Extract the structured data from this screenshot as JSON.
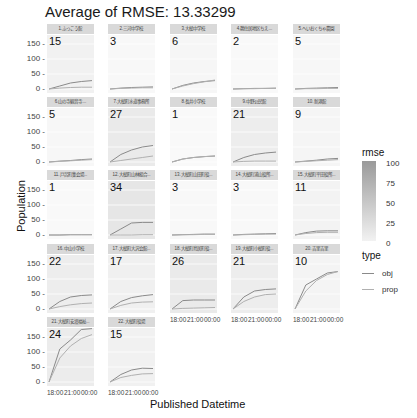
{
  "title": "Average of RMSE: 13.33299",
  "axes": {
    "ylabel": "Population",
    "xlabel": "Published Datetime",
    "yticks": [
      "150 -",
      "100 -",
      "50 -",
      "0 -"
    ],
    "xticks": [
      "18:00",
      "21:00",
      "00:00"
    ]
  },
  "legend": {
    "rmse_title": "rmse",
    "rmse_ticks": [
      "100",
      "75",
      "50",
      "25",
      "0"
    ],
    "type_title": "type",
    "type_items": [
      {
        "label": "obj",
        "color": "#8a8a8a"
      },
      {
        "label": "prop",
        "color": "#b0b0b0"
      }
    ]
  },
  "chart_data": {
    "type": "line",
    "title": "Average of RMSE: 13.33299",
    "xlabel": "Published Datetime",
    "ylabel": "Population",
    "ylim": [
      0,
      160
    ],
    "x_ticks": [
      "18:00",
      "21:00",
      "00:00"
    ],
    "facets": [
      {
        "label": "1.ふっこう館",
        "rmse": 15,
        "obj": [
          0,
          10,
          20,
          25,
          28
        ],
        "prop": [
          0,
          3,
          5,
          6,
          6
        ]
      },
      {
        "label": "2.三河中学校",
        "rmse": 3,
        "obj": [
          0,
          3,
          5,
          6,
          7
        ],
        "prop": [
          0,
          2,
          3,
          4,
          4
        ]
      },
      {
        "label": "3.大槌中学校",
        "rmse": 6,
        "obj": [
          0,
          12,
          20,
          25,
          28
        ],
        "prop": [
          0,
          10,
          18,
          24,
          30
        ]
      },
      {
        "label": "4.鵜住居地区ちえ...",
        "rmse": 2,
        "obj": [
          0,
          1,
          2,
          2,
          3
        ],
        "prop": [
          0,
          1,
          1,
          2,
          2
        ]
      },
      {
        "label": "5.へいおくちゃ農園",
        "rmse": 5,
        "obj": [
          0,
          2,
          3,
          4,
          5
        ],
        "prop": [
          0,
          1,
          1,
          2,
          2
        ]
      },
      {
        "label": "6.山の寺観音寺...",
        "rmse": 5,
        "obj": [
          0,
          3,
          5,
          8,
          10
        ],
        "prop": [
          0,
          2,
          4,
          6,
          8
        ]
      },
      {
        "label": "7.大槌町水道事務所",
        "rmse": 27,
        "obj": [
          0,
          25,
          40,
          50,
          55
        ],
        "prop": [
          0,
          5,
          10,
          15,
          20
        ]
      },
      {
        "label": "8.長井小学校",
        "rmse": 1,
        "obj": [
          0,
          10,
          15,
          18,
          20
        ],
        "prop": [
          0,
          10,
          15,
          18,
          20
        ]
      },
      {
        "label": "9.中野公民館",
        "rmse": 21,
        "obj": [
          0,
          15,
          25,
          30,
          33
        ],
        "prop": [
          0,
          2,
          3,
          3,
          3
        ]
      },
      {
        "label": "10.新港館",
        "rmse": 9,
        "obj": [
          0,
          3,
          6,
          10,
          12
        ],
        "prop": [
          0,
          2,
          4,
          6,
          8
        ]
      },
      {
        "label": "11.戸呂町集会場...",
        "rmse": 1,
        "obj": [
          0,
          0,
          1,
          1,
          1
        ],
        "prop": [
          0,
          0,
          1,
          1,
          1
        ]
      },
      {
        "label": "12.大槌町山林組合...",
        "rmse": 34,
        "obj": [
          0,
          20,
          40,
          42,
          42
        ],
        "prop": [
          0,
          0,
          0,
          1,
          1
        ]
      },
      {
        "label": "13.大槌町山田町役...",
        "rmse": 3,
        "obj": [
          0,
          1,
          2,
          3,
          3
        ],
        "prop": [
          0,
          1,
          1,
          2,
          2
        ]
      },
      {
        "label": "14.大槌町浦山役所...",
        "rmse": 3,
        "obj": [
          0,
          2,
          3,
          4,
          5
        ],
        "prop": [
          0,
          1,
          2,
          3,
          3
        ]
      },
      {
        "label": "15.大槌町平田役所...",
        "rmse": 11,
        "obj": [
          0,
          8,
          13,
          14,
          14
        ],
        "prop": [
          0,
          5,
          8,
          9,
          9
        ]
      },
      {
        "label": "16.中山小学校",
        "rmse": 22,
        "obj": [
          0,
          25,
          40,
          45,
          47
        ],
        "prop": [
          0,
          8,
          14,
          18,
          20
        ]
      },
      {
        "label": "17.大槌町大沢会館...",
        "rmse": 17,
        "obj": [
          0,
          25,
          38,
          44,
          48
        ],
        "prop": [
          0,
          12,
          20,
          23,
          24
        ]
      },
      {
        "label": "18.大槌町鳥居町役...",
        "rmse": 26,
        "obj": [
          0,
          28,
          30,
          30,
          30
        ],
        "prop": [
          0,
          2,
          3,
          4,
          5
        ]
      },
      {
        "label": "19.大槌町小槌町役...",
        "rmse": 21,
        "obj": [
          0,
          40,
          60,
          65,
          67
        ],
        "prop": [
          0,
          25,
          40,
          48,
          50
        ]
      },
      {
        "label": "20.吉里吉里",
        "rmse": 10,
        "obj": [
          0,
          80,
          100,
          120,
          125
        ],
        "prop": [
          0,
          60,
          95,
          115,
          125
        ]
      },
      {
        "label": "21.大槌町安渡福祉...",
        "rmse": 24,
        "obj": [
          0,
          110,
          140,
          175,
          178
        ],
        "prop": [
          0,
          80,
          120,
          145,
          158
        ]
      },
      {
        "label": "22.大槌町役場",
        "rmse": 15,
        "obj": [
          0,
          25,
          40,
          46,
          45
        ],
        "prop": [
          0,
          15,
          22,
          27,
          28
        ]
      }
    ]
  }
}
